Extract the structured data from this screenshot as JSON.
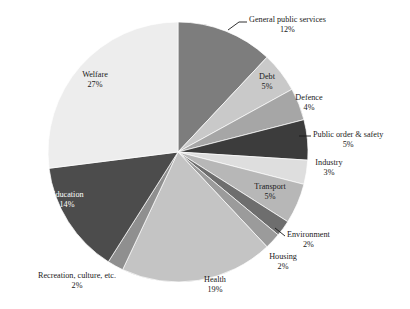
{
  "chart_data": {
    "type": "pie",
    "title": "",
    "subtitle": "",
    "xlabel": "",
    "ylabel": "",
    "legend_position": "none",
    "grid": false,
    "units": "percent",
    "categories": [
      "General public services",
      "Debt",
      "Defence",
      "Public order & safety",
      "Industry",
      "Transport",
      "Environment",
      "Housing",
      "Health",
      "Recreation, culture, etc.",
      "Education",
      "Welfare"
    ],
    "values": [
      12,
      5,
      4,
      5,
      3,
      5,
      2,
      2,
      19,
      2,
      14,
      27
    ],
    "colors": [
      "#7d7d7d",
      "#c9c9c9",
      "#a6a6a6",
      "#3c3c3c",
      "#dedede",
      "#b7b7b7",
      "#6e6e6e",
      "#9b9b9b",
      "#c4c4c4",
      "#8f8f8f",
      "#4c4c4c",
      "#ededed"
    ],
    "start_angle_deg": 0,
    "direction": "clockwise",
    "slices": [
      {
        "name": "General public services",
        "value": 12,
        "value_label": "12%",
        "color": "#7d7d7d",
        "label_placement": "outside",
        "has_leader_line": true
      },
      {
        "name": "Debt",
        "value": 5,
        "value_label": "5%",
        "color": "#c9c9c9",
        "label_placement": "outside",
        "has_leader_line": false
      },
      {
        "name": "Defence",
        "value": 4,
        "value_label": "4%",
        "color": "#a6a6a6",
        "label_placement": "outside",
        "has_leader_line": false
      },
      {
        "name": "Public order & safety",
        "value": 5,
        "value_label": "5%",
        "color": "#3c3c3c",
        "label_placement": "outside",
        "has_leader_line": true
      },
      {
        "name": "Industry",
        "value": 3,
        "value_label": "3%",
        "color": "#dedede",
        "label_placement": "outside",
        "has_leader_line": false
      },
      {
        "name": "Transport",
        "value": 5,
        "value_label": "5%",
        "color": "#b7b7b7",
        "label_placement": "outside",
        "has_leader_line": false
      },
      {
        "name": "Environment",
        "value": 2,
        "value_label": "2%",
        "color": "#6e6e6e",
        "label_placement": "outside",
        "has_leader_line": true
      },
      {
        "name": "Housing",
        "value": 2,
        "value_label": "2%",
        "color": "#9b9b9b",
        "label_placement": "outside",
        "has_leader_line": false
      },
      {
        "name": "Health",
        "value": 19,
        "value_label": "19%",
        "color": "#c4c4c4",
        "label_placement": "outside",
        "has_leader_line": false
      },
      {
        "name": "Recreation, culture, etc.",
        "value": 2,
        "value_label": "2%",
        "color": "#8f8f8f",
        "label_placement": "outside",
        "has_leader_line": false
      },
      {
        "name": "Education",
        "value": 14,
        "value_label": "14%",
        "color": "#4c4c4c",
        "label_placement": "inside",
        "has_leader_line": false
      },
      {
        "name": "Welfare",
        "value": 27,
        "value_label": "27%",
        "color": "#ededed",
        "label_placement": "inside",
        "has_leader_line": false
      }
    ]
  },
  "labels": {
    "general_public_services": {
      "name": "General public services",
      "pct": "12%"
    },
    "debt": {
      "name": "Debt",
      "pct": "5%"
    },
    "defence": {
      "name": "Defence",
      "pct": "4%"
    },
    "public_order": {
      "name": "Public order & safety",
      "pct": "5%"
    },
    "industry": {
      "name": "Industry",
      "pct": "3%"
    },
    "transport": {
      "name": "Transport",
      "pct": "5%"
    },
    "environment": {
      "name": "Environment",
      "pct": "2%"
    },
    "housing": {
      "name": "Housing",
      "pct": "2%"
    },
    "health": {
      "name": "Health",
      "pct": "19%"
    },
    "recreation": {
      "name": "Recreation, culture, etc.",
      "pct": "2%"
    },
    "education": {
      "name": "Education",
      "pct": "14%"
    },
    "welfare": {
      "name": "Welfare",
      "pct": "27%"
    }
  }
}
